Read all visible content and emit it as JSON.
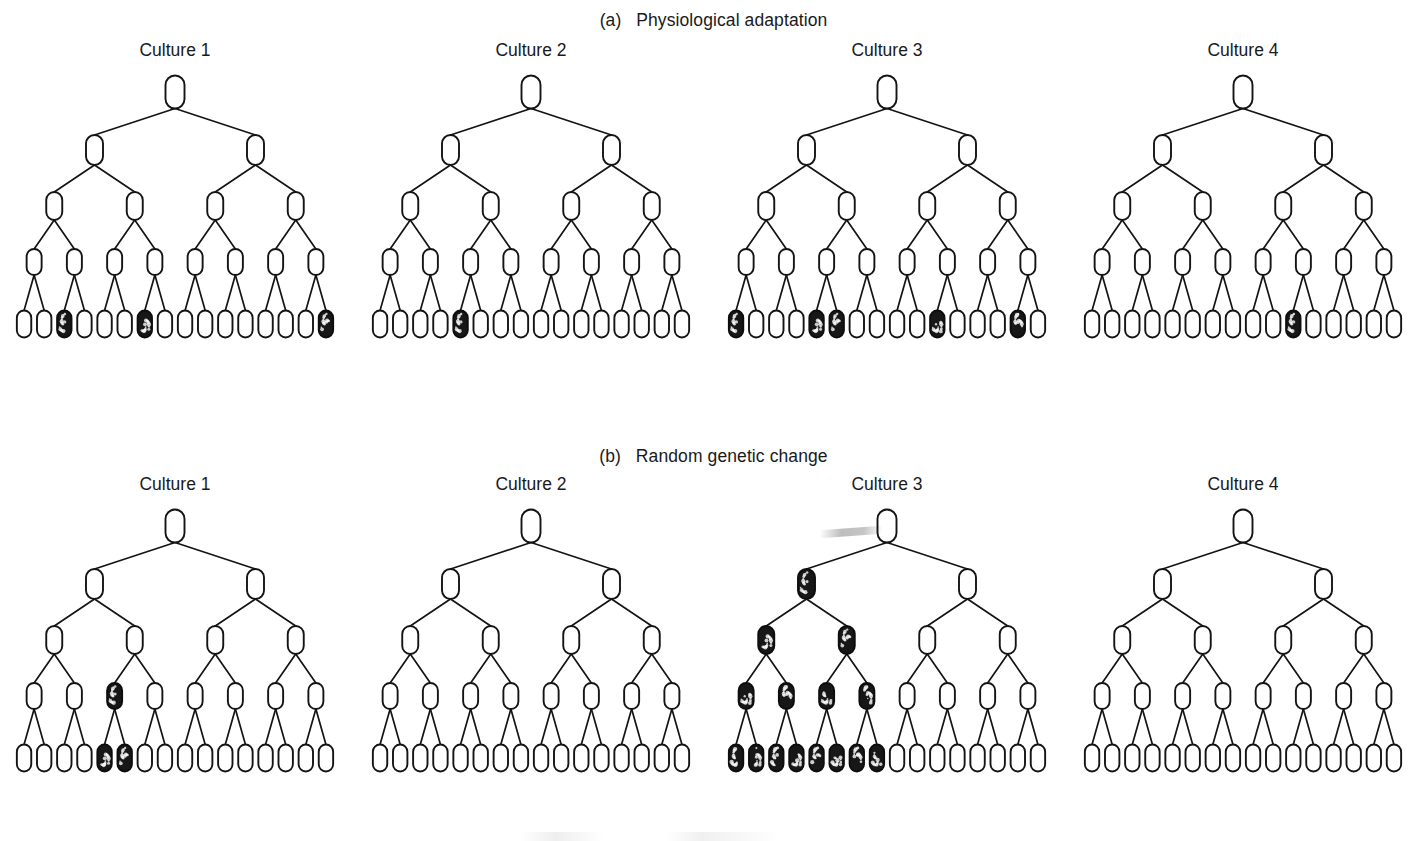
{
  "figure": {
    "kind": "lineage-tree-diagram",
    "width": 1427,
    "height": 841,
    "background_color": "#ffffff",
    "ink_color": "#141414",
    "mutant_fill_color": "#171717"
  },
  "panels": [
    {
      "id": "a",
      "title": "(a)   Physiological adaptation",
      "cultures": [
        {
          "label": "Culture 1"
        },
        {
          "label": "Culture 2"
        },
        {
          "label": "Culture 3"
        },
        {
          "label": "Culture 4"
        }
      ]
    },
    {
      "id": "b",
      "title": "(b)   Random genetic change",
      "cultures": [
        {
          "label": "Culture 1"
        },
        {
          "label": "Culture 2"
        },
        {
          "label": "Culture 3"
        },
        {
          "label": "Culture 4"
        }
      ]
    }
  ],
  "chart_data": {
    "type": "diagram",
    "subcharts": [
      {
        "panel": "a",
        "panel_title": "(a)   Physiological adaptation",
        "generations": 5,
        "cells_per_generation": [
          1,
          2,
          4,
          8,
          16
        ],
        "cultures": [
          {
            "label": "Culture 1",
            "mutant_positions_by_generation": {
              "1": [],
              "2": [],
              "3": [],
              "4": [],
              "5": [
                3,
                7,
                16
              ]
            },
            "mutant_count_final": 3
          },
          {
            "label": "Culture 2",
            "mutant_positions_by_generation": {
              "1": [],
              "2": [],
              "3": [],
              "4": [],
              "5": [
                5
              ]
            },
            "mutant_count_final": 1
          },
          {
            "label": "Culture 3",
            "mutant_positions_by_generation": {
              "1": [],
              "2": [],
              "3": [],
              "4": [],
              "5": [
                1,
                5,
                6,
                11,
                15
              ]
            },
            "mutant_count_final": 5
          },
          {
            "label": "Culture 4",
            "mutant_positions_by_generation": {
              "1": [],
              "2": [],
              "3": [],
              "4": [],
              "5": [
                11
              ]
            },
            "mutant_count_final": 1
          }
        ],
        "note": "Mutants appear only in the final generation; small, similar numbers per culture (low variance)"
      },
      {
        "panel": "b",
        "panel_title": "(b)   Random genetic change",
        "generations": 5,
        "cells_per_generation": [
          1,
          2,
          4,
          8,
          16
        ],
        "cultures": [
          {
            "label": "Culture 1",
            "mutant_positions_by_generation": {
              "1": [],
              "2": [],
              "3": [],
              "4": [
                3
              ],
              "5": [
                5,
                6
              ]
            },
            "mutant_count_final": 2
          },
          {
            "label": "Culture 2",
            "mutant_positions_by_generation": {
              "1": [],
              "2": [],
              "3": [],
              "4": [],
              "5": []
            },
            "mutant_count_final": 0
          },
          {
            "label": "Culture 3",
            "mutant_positions_by_generation": {
              "1": [],
              "2": [
                1
              ],
              "3": [
                1,
                2
              ],
              "4": [
                1,
                2,
                3,
                4
              ],
              "5": [
                1,
                2,
                3,
                4,
                5,
                6,
                7,
                8
              ]
            },
            "mutant_count_final": 8
          },
          {
            "label": "Culture 4",
            "mutant_positions_by_generation": {
              "1": [],
              "2": [],
              "3": [],
              "4": [],
              "5": []
            },
            "mutant_count_final": 0
          }
        ],
        "note": "Mutation arises at a random generation and is inherited by all descendants; final mutant counts fluctuate widely (0, 0, 2, 8)"
      }
    ]
  }
}
